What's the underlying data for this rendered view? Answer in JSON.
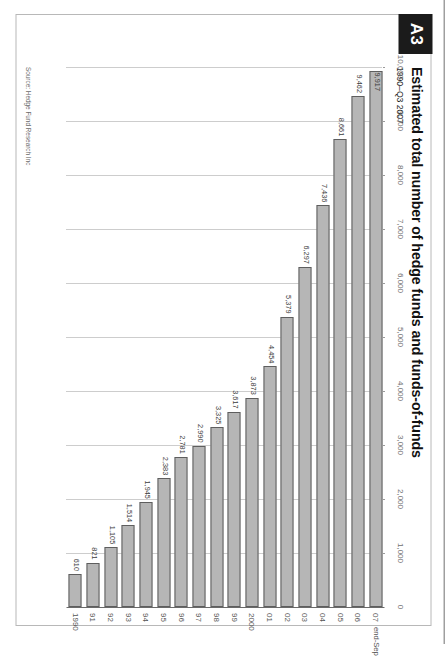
{
  "badge": {
    "label": "A3"
  },
  "header": {
    "title": "Estimated total number of hedge funds and funds-of-funds",
    "subtitle": "1990–Q3 2007"
  },
  "footer": {
    "source": "Source: Hedge Fund Research Inc"
  },
  "axis_note": {
    "label": "end-Sep"
  },
  "chart_data": {
    "type": "bar",
    "orientation": "horizontal",
    "title": "Estimated total number of hedge funds and funds-of-funds",
    "subtitle": "1990–Q3 2007",
    "xlabel": "",
    "ylabel": "",
    "xlim": [
      0,
      10000
    ],
    "grid": true,
    "legend": "none",
    "tick_labels": [
      "10,000",
      "9,000",
      "8,000",
      "7,000",
      "6,000",
      "5,000",
      "4,000",
      "3,000",
      "2,000",
      "1,000",
      "0"
    ],
    "ticks": [
      10000,
      9000,
      8000,
      7000,
      6000,
      5000,
      4000,
      3000,
      2000,
      1000,
      0
    ],
    "categories": [
      "1990",
      "91",
      "92",
      "93",
      "94",
      "95",
      "96",
      "97",
      "98",
      "99",
      "2000",
      "01",
      "02",
      "03",
      "04",
      "05",
      "06",
      "07"
    ],
    "values": [
      610,
      821,
      1105,
      1514,
      1945,
      2383,
      2781,
      2990,
      3325,
      3617,
      3873,
      4454,
      5379,
      6297,
      7436,
      8661,
      9462,
      9917
    ],
    "value_labels": [
      "610",
      "821",
      "1,105",
      "1,514",
      "1,945",
      "2,383",
      "2,781",
      "2,990",
      "3,325",
      "3,617",
      "3,873",
      "4,454",
      "5,379",
      "6,297",
      "7,436",
      "8,661",
      "9,462",
      "9,917"
    ],
    "bar_color": "#b6b6b6",
    "bar_edge_color": "#5e5e5e"
  }
}
